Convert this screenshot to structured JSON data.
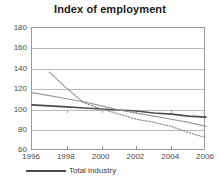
{
  "chart_data": {
    "type": "line",
    "title": "Index of employment",
    "xlabel": "",
    "ylabel": "",
    "xlim": [
      1996,
      2006
    ],
    "ylim": [
      60,
      180
    ],
    "yticks": [
      60,
      80,
      100,
      120,
      140,
      160,
      180
    ],
    "xticks": [
      1996,
      1998,
      2000,
      2002,
      2004,
      2006
    ],
    "grid": true,
    "legend_position": "bottom-left",
    "series": [
      {
        "name": "Total industry",
        "style": "solid",
        "color": "#4d4d4d",
        "width": 1.6,
        "x": [
          1996,
          1997,
          1998,
          1999,
          2000,
          2001,
          2002,
          2003,
          2004,
          2005,
          2006
        ],
        "values": [
          105,
          104,
          103,
          102,
          101,
          100,
          99,
          97,
          96,
          94,
          93
        ]
      },
      {
        "name": "Series 2",
        "style": "solid",
        "color": "#9b9b9b",
        "width": 1.2,
        "x": [
          1996,
          1997,
          1998,
          1999,
          2000,
          2001,
          2002,
          2003,
          2004,
          2005,
          2006
        ],
        "values": [
          117,
          114,
          111,
          108,
          104,
          100,
          97,
          94,
          91,
          88,
          84
        ]
      },
      {
        "name": "Series 3",
        "style": "dotted",
        "color": "#8a8a8a",
        "width": 1.2,
        "x": [
          1997,
          1998,
          1999,
          2000,
          2001,
          2002,
          2003,
          2004,
          2005,
          2006
        ],
        "values": [
          137,
          121,
          107,
          101,
          96,
          91,
          88,
          84,
          78,
          73
        ]
      }
    ]
  },
  "legend": {
    "entries": [
      {
        "label": "Total industry",
        "color": "#4d4d4d"
      }
    ]
  },
  "axis": {
    "y_labels": [
      "180",
      "160",
      "140",
      "120",
      "100",
      "80",
      "60"
    ],
    "x_labels": [
      "1996",
      "1998",
      "2000",
      "2002",
      "2004",
      "2006"
    ]
  }
}
